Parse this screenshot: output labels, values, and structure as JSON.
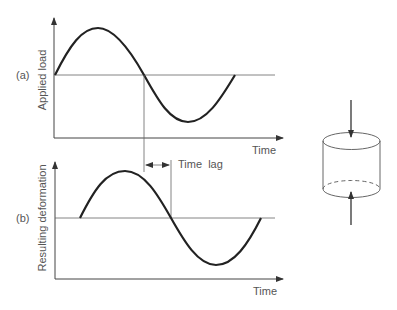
{
  "figure": {
    "panel_a": {
      "label": "(a)",
      "ylabel": "Applied load",
      "xlabel": "Time"
    },
    "panel_b": {
      "label": "(b)",
      "ylabel": "Resulting deformation",
      "xlabel": "Time"
    },
    "annotation": {
      "time_lag": "Time  lag"
    },
    "specimen": {
      "shape": "cylinder",
      "loading": "compressive load arrows top and bottom"
    },
    "colors": {
      "curve": "#222222",
      "axis": "#444444",
      "text": "#555555"
    }
  }
}
